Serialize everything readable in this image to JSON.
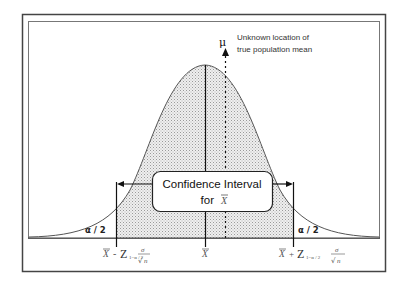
{
  "figure": {
    "mu_symbol": "μ",
    "mu_note_line1": "Unknown location of",
    "mu_note_line2": "true population mean",
    "ci_box_line1": "Confidence Interval",
    "ci_box_line2_prefix": "for",
    "ci_box_line2_symbol": "X",
    "left_tail_label": "α / 2",
    "right_tail_label": "α / 2",
    "x_labels": {
      "left": {
        "xbar": "X",
        "op": "-",
        "z": "Z",
        "subscript": "1−α / 2",
        "numerator": "σ",
        "denominator": "n"
      },
      "center": {
        "xbar": "X"
      },
      "right": {
        "xbar": "X",
        "op": "+",
        "z": "Z",
        "subscript": "1−α / 2",
        "numerator": "σ",
        "denominator": "n"
      }
    }
  },
  "colors": {
    "frame": "#444444",
    "curve": "#555555",
    "shade": "#d9d9d9",
    "line": "#111111",
    "background": "#ffffff"
  }
}
